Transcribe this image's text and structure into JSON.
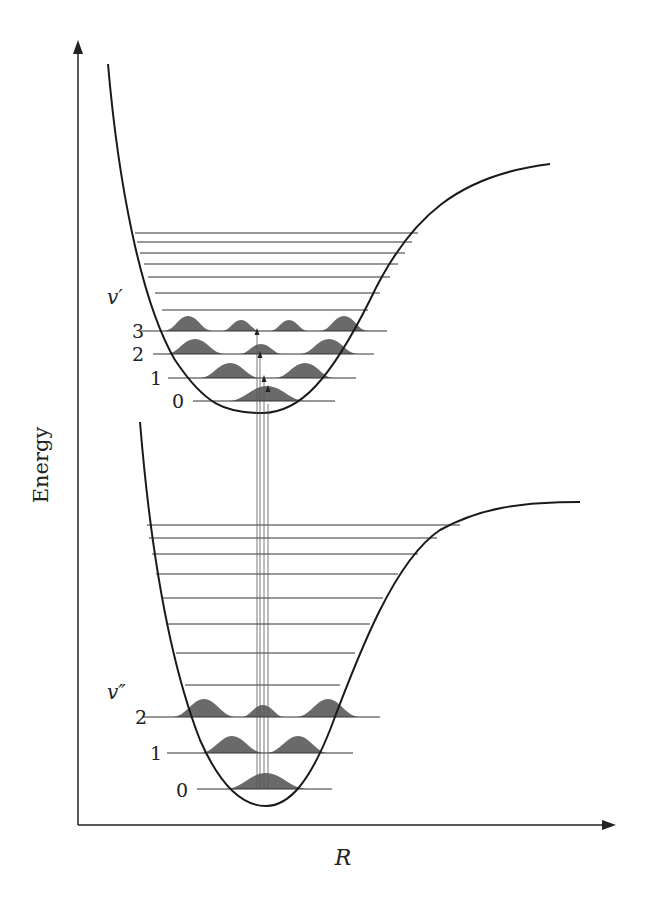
{
  "diagram": {
    "y_axis_label": "Energy",
    "x_axis_label": "R",
    "upper_state": {
      "label": "v′",
      "levels": [
        {
          "label": "0",
          "y": 401
        },
        {
          "label": "1",
          "y": 378
        },
        {
          "label": "2",
          "y": 354
        },
        {
          "label": "3",
          "y": 331
        }
      ],
      "higher_levels_y": [
        310,
        293,
        277,
        264,
        253,
        242,
        233
      ]
    },
    "lower_state": {
      "label": "v″",
      "levels": [
        {
          "label": "0",
          "y": 789
        },
        {
          "label": "1",
          "y": 753
        },
        {
          "label": "2",
          "y": 717
        }
      ],
      "higher_levels_y": [
        685,
        653,
        624,
        598,
        574,
        554,
        538,
        525
      ]
    },
    "colors": {
      "curve": "#1a1a1a",
      "wavefunction_fill": "#6a6a6a",
      "background": "#ffffff"
    }
  }
}
